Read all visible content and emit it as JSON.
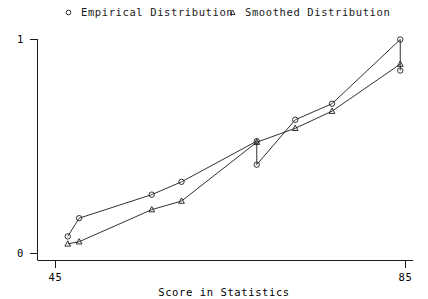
{
  "legend": {
    "position": "top",
    "entries": [
      {
        "label": "Empirical Distribution",
        "marker": "circle-marker-icon"
      },
      {
        "label": "Smoothed Distribution",
        "marker": "triangle-marker-icon"
      }
    ]
  },
  "axes": {
    "x": {
      "label": "Score in Statistics",
      "ticks": [
        "45",
        "85"
      ],
      "min": 45,
      "max": 85
    },
    "y": {
      "label": "",
      "ticks": [
        "0",
        "1"
      ],
      "min": 0,
      "max": 1
    }
  },
  "colors": {
    "ink": "#1a1a1a",
    "background": "#ffffff"
  },
  "chart_data": {
    "type": "line",
    "title": "",
    "xlabel": "Score in Statistics",
    "ylabel": "",
    "xlim": [
      45,
      85
    ],
    "ylim": [
      0,
      1
    ],
    "xticks": [
      45,
      85
    ],
    "yticks": [
      0,
      1
    ],
    "grid": false,
    "legend_position": "top",
    "series": [
      {
        "name": "Empirical Distribution",
        "marker": "circle",
        "x": [
          46.4,
          47.7,
          56.0,
          59.4,
          68.0,
          68.0,
          72.4,
          76.6,
          84.4,
          84.4
        ],
        "y": [
          0.08,
          0.165,
          0.275,
          0.335,
          0.525,
          0.415,
          0.625,
          0.7,
          1.0,
          0.855
        ]
      },
      {
        "name": "Smoothed Distribution",
        "marker": "triangle",
        "x": [
          46.4,
          47.7,
          56.0,
          59.4,
          68.0,
          72.4,
          76.6,
          84.4
        ],
        "y": [
          0.045,
          0.055,
          0.205,
          0.245,
          0.52,
          0.585,
          0.665,
          0.885
        ]
      }
    ]
  }
}
